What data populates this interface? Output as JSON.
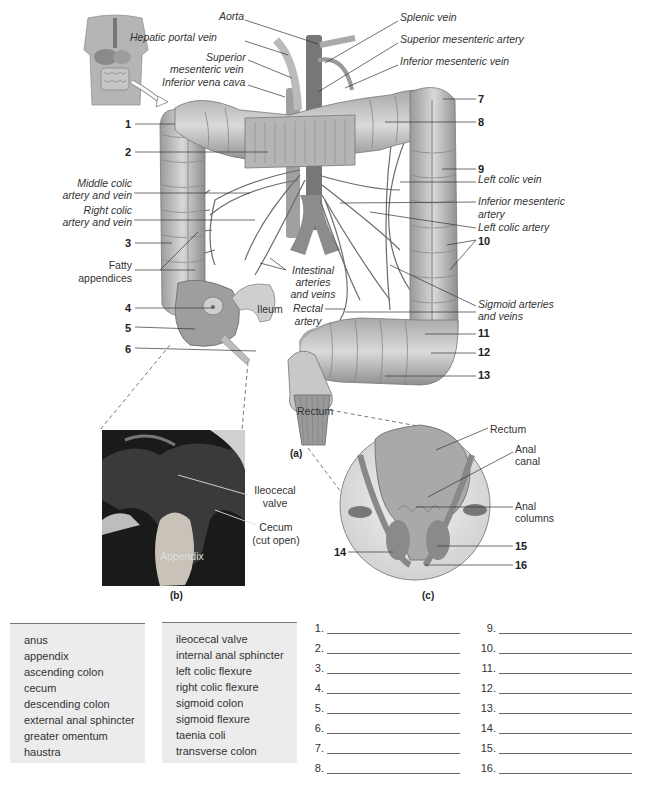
{
  "figure": {
    "panel_a": {
      "caption": "(a)",
      "labels_left": [
        {
          "id": "hepatic-portal-vein",
          "text": "Hepatic portal vein",
          "x": 132,
          "y": 36
        },
        {
          "id": "aorta",
          "text": "Aorta",
          "x": 219,
          "y": 15
        },
        {
          "id": "superior-mesenteric-vein-1",
          "text": "Superior",
          "x": 206,
          "y": 55
        },
        {
          "id": "superior-mesenteric-vein-2",
          "text": "mesenteric vein",
          "x": 171,
          "y": 67
        },
        {
          "id": "inferior-vena-cava",
          "text": "Inferior vena cava",
          "x": 162,
          "y": 80
        },
        {
          "id": "middle-colic-1",
          "text": "Middle colic",
          "x": 74,
          "y": 182
        },
        {
          "id": "middle-colic-2",
          "text": "artery and vein",
          "x": 62,
          "y": 194
        },
        {
          "id": "right-colic-1",
          "text": "Right colic",
          "x": 81,
          "y": 209
        },
        {
          "id": "right-colic-2",
          "text": "artery and vein",
          "x": 62,
          "y": 221
        },
        {
          "id": "fatty-1",
          "text": "Fatty",
          "x": 109,
          "y": 264
        },
        {
          "id": "fatty-2",
          "text": "appendices",
          "x": 77,
          "y": 277
        }
      ],
      "labels_right": [
        {
          "id": "splenic-vein",
          "text": "Splenic vein",
          "x": 400,
          "y": 16
        },
        {
          "id": "superior-mesenteric-artery",
          "text": "Superior mesenteric artery",
          "x": 400,
          "y": 38
        },
        {
          "id": "inferior-mesenteric-vein",
          "text": "Inferior mesenteric vein",
          "x": 400,
          "y": 60
        },
        {
          "id": "left-colic-vein",
          "text": "Left colic vein",
          "x": 478,
          "y": 176
        },
        {
          "id": "inferior-mesenteric-artery-1",
          "text": "Inferior mesenteric",
          "x": 478,
          "y": 196
        },
        {
          "id": "inferior-mesenteric-artery-2",
          "text": "artery",
          "x": 478,
          "y": 209
        },
        {
          "id": "left-colic-artery",
          "text": "Left colic artery",
          "x": 478,
          "y": 222
        },
        {
          "id": "sigmoid-1",
          "text": "Sigmoid arteries",
          "x": 478,
          "y": 298
        },
        {
          "id": "sigmoid-2",
          "text": "and veins",
          "x": 478,
          "y": 310
        }
      ],
      "labels_center": [
        {
          "id": "intestinal-1",
          "text": "Intestinal",
          "x": 287,
          "y": 265
        },
        {
          "id": "intestinal-2",
          "text": "arteries",
          "x": 292,
          "y": 277
        },
        {
          "id": "intestinal-3",
          "text": "and veins",
          "x": 286,
          "y": 289
        },
        {
          "id": "rectal-artery-1",
          "text": "Rectal",
          "x": 294,
          "y": 304
        },
        {
          "id": "rectal-artery-2",
          "text": "artery",
          "x": 295,
          "y": 317
        },
        {
          "id": "ileum",
          "text": "Ileum",
          "x": 257,
          "y": 304
        },
        {
          "id": "rectum-a",
          "text": "Rectum",
          "x": 297,
          "y": 407
        }
      ],
      "numbers": [
        {
          "n": "1",
          "x": 126,
          "y": 119
        },
        {
          "n": "2",
          "x": 126,
          "y": 147
        },
        {
          "n": "3",
          "x": 126,
          "y": 238
        },
        {
          "n": "4",
          "x": 126,
          "y": 303
        },
        {
          "n": "5",
          "x": 126,
          "y": 323
        },
        {
          "n": "6",
          "x": 126,
          "y": 344
        },
        {
          "n": "7",
          "x": 478,
          "y": 94
        },
        {
          "n": "8",
          "x": 478,
          "y": 117
        },
        {
          "n": "9",
          "x": 478,
          "y": 164
        },
        {
          "n": "10",
          "x": 478,
          "y": 236
        },
        {
          "n": "11",
          "x": 478,
          "y": 328
        },
        {
          "n": "12",
          "x": 478,
          "y": 347
        },
        {
          "n": "13",
          "x": 478,
          "y": 370
        }
      ]
    },
    "panel_b": {
      "caption": "(b)",
      "labels": [
        {
          "id": "ileocecal-valve-1",
          "text": "Ileocecal",
          "x": 250,
          "y": 484
        },
        {
          "id": "ileocecal-valve-2",
          "text": "valve",
          "x": 258,
          "y": 497
        },
        {
          "id": "cecum-1",
          "text": "Cecum",
          "x": 257,
          "y": 521
        },
        {
          "id": "cecum-2",
          "text": "(cut open)",
          "x": 247,
          "y": 534
        }
      ],
      "photo_label": "Appendix"
    },
    "panel_c": {
      "caption": "(c)",
      "labels": [
        {
          "id": "rectum-c",
          "text": "Rectum",
          "x": 490,
          "y": 423
        },
        {
          "id": "anal-canal-1",
          "text": "Anal",
          "x": 515,
          "y": 443
        },
        {
          "id": "anal-canal-2",
          "text": "canal",
          "x": 515,
          "y": 455
        },
        {
          "id": "anal-columns-1",
          "text": "Anal",
          "x": 515,
          "y": 500
        },
        {
          "id": "anal-columns-2",
          "text": "columns",
          "x": 515,
          "y": 512
        }
      ],
      "numbers": [
        {
          "n": "14",
          "x": 334,
          "y": 546
        },
        {
          "n": "15",
          "x": 515,
          "y": 541
        },
        {
          "n": "16",
          "x": 515,
          "y": 560
        }
      ]
    }
  },
  "word_bank": {
    "column_1": [
      "anus",
      "appendix",
      "ascending colon",
      "cecum",
      "descending colon",
      "external anal sphincter",
      "greater omentum",
      "haustra"
    ],
    "column_2": [
      "ileocecal valve",
      "internal anal sphincter",
      "left colic flexure",
      "right colic flexure",
      "sigmoid colon",
      "sigmoid flexure",
      "taenia coli",
      "transverse colon"
    ]
  },
  "answers": {
    "column_1": [
      {
        "n": "1.",
        "value": ""
      },
      {
        "n": "2.",
        "value": ""
      },
      {
        "n": "3.",
        "value": ""
      },
      {
        "n": "4.",
        "value": ""
      },
      {
        "n": "5.",
        "value": ""
      },
      {
        "n": "6.",
        "value": ""
      },
      {
        "n": "7.",
        "value": ""
      },
      {
        "n": "8.",
        "value": ""
      }
    ],
    "column_2": [
      {
        "n": "9.",
        "value": ""
      },
      {
        "n": "10.",
        "value": ""
      },
      {
        "n": "11.",
        "value": ""
      },
      {
        "n": "12.",
        "value": ""
      },
      {
        "n": "13.",
        "value": ""
      },
      {
        "n": "14.",
        "value": ""
      },
      {
        "n": "15.",
        "value": ""
      },
      {
        "n": "16.",
        "value": ""
      }
    ]
  }
}
